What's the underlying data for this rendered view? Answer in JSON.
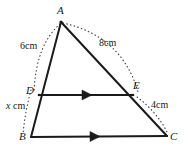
{
  "figure": {
    "background_color": "#ffffff",
    "stroke_color": "#1a1a1a",
    "dotted_color": "#3a3a3a",
    "vertices": [
      {
        "id": "A",
        "label": "A",
        "x": 61,
        "y": 22,
        "label_x": 57,
        "label_y": 6
      },
      {
        "id": "B",
        "label": "B",
        "x": 31,
        "y": 137,
        "label_x": 20,
        "label_y": 137
      },
      {
        "id": "C",
        "label": "C",
        "x": 167,
        "y": 136,
        "label_x": 170,
        "label_y": 136
      },
      {
        "id": "D",
        "label": "D",
        "x": 39,
        "y": 95,
        "label_x": 26,
        "label_y": 90
      },
      {
        "id": "E",
        "label": "E",
        "x": 133,
        "y": 95,
        "label_x": 133,
        "label_y": 84
      }
    ],
    "solid_edges": [
      {
        "name": "edge-A-B",
        "from": "A",
        "to": "B"
      },
      {
        "name": "edge-A-C",
        "from": "A",
        "to": "C"
      },
      {
        "name": "edge-B-C",
        "from": "B",
        "to": "C"
      },
      {
        "name": "edge-D-E",
        "from": "D",
        "to": "E"
      }
    ],
    "parallel_marks": [
      {
        "name": "arrow-marker-de",
        "on": "edge-D-E",
        "direction": "right"
      },
      {
        "name": "arrow-marker-bc",
        "on": "edge-B-C",
        "direction": "right"
      }
    ],
    "measures": [
      {
        "name": "measure-ad",
        "text": "6cm",
        "segment": "A-D",
        "x": 21,
        "y": 45,
        "italic_prefix": ""
      },
      {
        "name": "measure-ae",
        "text": "8cm",
        "segment": "A-E",
        "x": 100,
        "y": 42,
        "italic_prefix": ""
      },
      {
        "name": "measure-db",
        "text": "cm",
        "segment": "D-B",
        "x": 7,
        "y": 105,
        "italic_prefix": "x"
      },
      {
        "name": "measure-ec",
        "text": "4cm",
        "segment": "E-C",
        "x": 152,
        "y": 104,
        "italic_prefix": ""
      }
    ]
  }
}
